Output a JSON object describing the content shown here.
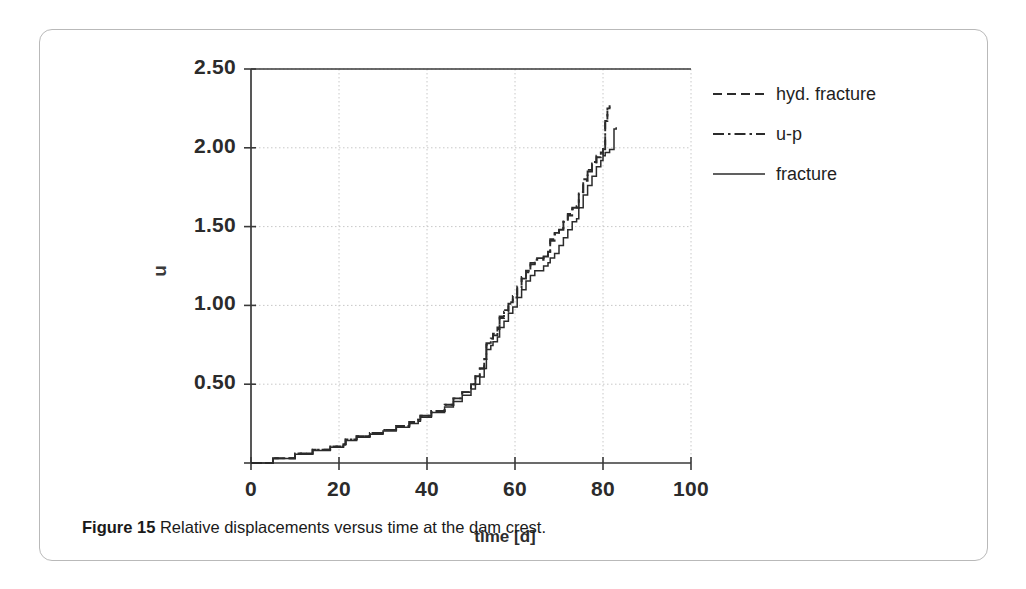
{
  "figure": {
    "caption_label": "Figure 15",
    "caption_text": "Relative displacements versus time at the dam crest."
  },
  "legend": {
    "position": "right",
    "items": [
      {
        "label": "hyd. fracture",
        "style": "dashed"
      },
      {
        "label": "u-p",
        "style": "dash-dot"
      },
      {
        "label": "fracture",
        "style": "solid"
      }
    ]
  },
  "axes": {
    "x_title": "time [d]",
    "y_title": "u",
    "x_ticks": [
      "0",
      "20",
      "40",
      "60",
      "80",
      "100"
    ],
    "y_ticks": [
      "2.50",
      "2.00",
      "1.50",
      "1.00",
      "0.50"
    ]
  },
  "chart_data": {
    "type": "line",
    "title": "Relative displacements versus time at the dam crest.",
    "xlabel": "time [d]",
    "ylabel": "u",
    "xlim": [
      0,
      100
    ],
    "ylim": [
      0,
      2.5
    ],
    "xticks": [
      0,
      20,
      40,
      60,
      80,
      100
    ],
    "yticks": [
      0.5,
      1.0,
      1.5,
      2.0,
      2.5
    ],
    "grid": true,
    "legend_position": "upper right outside",
    "line_color": "#2b2b2b",
    "step_style": "post",
    "series": [
      {
        "name": "hyd. fracture",
        "style": "dashed",
        "x": [
          0,
          5,
          10,
          14,
          18,
          21,
          21.5,
          24,
          27,
          30,
          33,
          36,
          38,
          38.5,
          41,
          44,
          46,
          48,
          50,
          51,
          52,
          53,
          53.5,
          54.5,
          55,
          56,
          56.5,
          57.5,
          58.5,
          59.5,
          60.5,
          61.5,
          62.5,
          63.5,
          64.5,
          65.5,
          66.5,
          67.5,
          68,
          69,
          70,
          71,
          72,
          73,
          74,
          74.5,
          75.5,
          76.5,
          77.5,
          78.5,
          79.5,
          80,
          80.5,
          81,
          81.5
        ],
        "y": [
          0.0,
          0.03,
          0.06,
          0.085,
          0.105,
          0.12,
          0.15,
          0.17,
          0.19,
          0.21,
          0.235,
          0.26,
          0.275,
          0.3,
          0.33,
          0.37,
          0.41,
          0.45,
          0.5,
          0.55,
          0.6,
          0.66,
          0.76,
          0.79,
          0.82,
          0.86,
          0.93,
          0.97,
          1.02,
          1.06,
          1.12,
          1.18,
          1.22,
          1.27,
          1.3,
          1.3,
          1.32,
          1.34,
          1.42,
          1.46,
          1.49,
          1.54,
          1.58,
          1.62,
          1.63,
          1.72,
          1.8,
          1.86,
          1.91,
          1.95,
          1.97,
          2.0,
          2.18,
          2.26,
          2.27
        ]
      },
      {
        "name": "u-p",
        "style": "dash-dot",
        "x": [
          0,
          5,
          10,
          14,
          18,
          21,
          21.5,
          24,
          27,
          30,
          33,
          36,
          38,
          38.5,
          41,
          44,
          46,
          48,
          50,
          51,
          52,
          53,
          53.5,
          54.5,
          55,
          56,
          56.5,
          57.5,
          58.5,
          59.5,
          60.5,
          61.5,
          62.5,
          63.5,
          64.5,
          65.5,
          66.5,
          67.5,
          68,
          69,
          70,
          71,
          72,
          73,
          74,
          74.5,
          75.5,
          76.5,
          77.5,
          78.5,
          79.5,
          80,
          80.5,
          81,
          81.5
        ],
        "y": [
          0.0,
          0.03,
          0.06,
          0.085,
          0.105,
          0.12,
          0.15,
          0.17,
          0.19,
          0.21,
          0.235,
          0.26,
          0.275,
          0.3,
          0.33,
          0.37,
          0.41,
          0.45,
          0.5,
          0.55,
          0.6,
          0.66,
          0.75,
          0.78,
          0.81,
          0.85,
          0.92,
          0.96,
          1.01,
          1.05,
          1.11,
          1.17,
          1.21,
          1.26,
          1.29,
          1.29,
          1.31,
          1.33,
          1.41,
          1.45,
          1.48,
          1.53,
          1.57,
          1.61,
          1.62,
          1.71,
          1.79,
          1.85,
          1.9,
          1.94,
          1.96,
          1.99,
          2.17,
          2.25,
          2.26
        ]
      },
      {
        "name": "fracture",
        "style": "solid",
        "x": [
          0,
          5,
          10,
          14,
          18,
          21,
          21.5,
          24,
          27,
          30,
          33,
          36,
          38,
          38.5,
          41,
          44,
          46,
          48,
          50,
          51,
          52,
          53,
          53.5,
          54.5,
          55,
          56,
          56.5,
          57.5,
          58.5,
          59.5,
          60.5,
          61.5,
          62.5,
          63.5,
          64.5,
          65.5,
          66.5,
          67.5,
          68,
          69,
          70,
          71,
          72,
          73,
          74,
          74.5,
          75.5,
          76.5,
          77.5,
          78.5,
          79.5,
          80,
          80.5,
          81.5,
          82.5,
          83
        ],
        "y": [
          0.0,
          0.028,
          0.055,
          0.08,
          0.1,
          0.115,
          0.143,
          0.163,
          0.183,
          0.203,
          0.227,
          0.25,
          0.265,
          0.29,
          0.32,
          0.355,
          0.39,
          0.43,
          0.47,
          0.5,
          0.545,
          0.6,
          0.72,
          0.745,
          0.77,
          0.8,
          0.86,
          0.9,
          0.95,
          0.99,
          1.05,
          1.1,
          1.155,
          1.19,
          1.22,
          1.22,
          1.25,
          1.27,
          1.3,
          1.33,
          1.38,
          1.43,
          1.48,
          1.53,
          1.55,
          1.62,
          1.7,
          1.76,
          1.82,
          1.88,
          1.92,
          1.95,
          1.97,
          1.99,
          2.12,
          2.13
        ]
      }
    ]
  }
}
